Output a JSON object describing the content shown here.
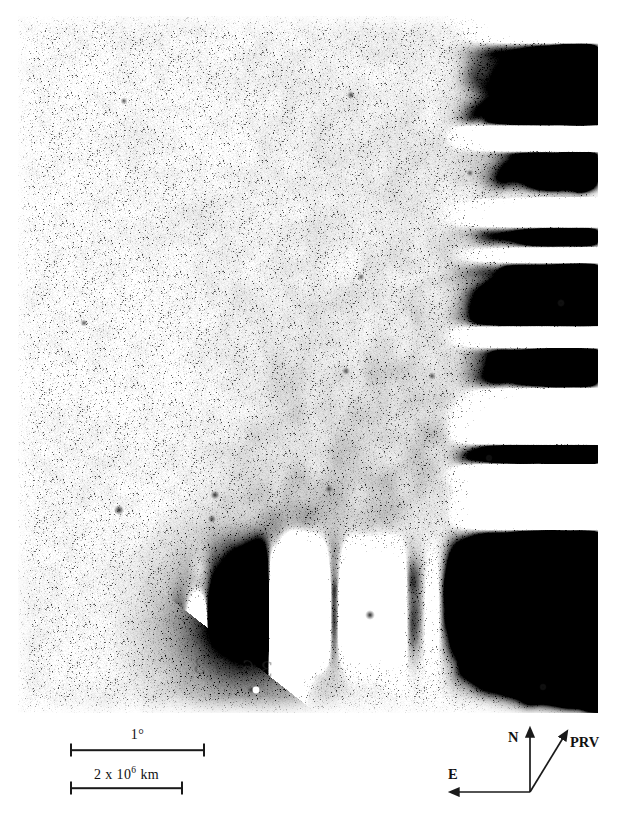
{
  "figure": {
    "kind": "astronomical-plate-photograph",
    "background_color": "#ffffff",
    "plate_tone": "#fbfbfb",
    "ink_color": "#1a1a1a"
  },
  "plate": {
    "annotation_text": "36.73",
    "emulsion": "grainy photographic negative (dark = bright sky objects)"
  },
  "scalebars": [
    {
      "id": "angular-scale",
      "label": "1",
      "label_suffix": "°",
      "label_full": "1°",
      "x": 70,
      "y": 750,
      "width": 135
    },
    {
      "id": "linear-scale",
      "label_prefix": "2 x 10",
      "label_exponent": "6",
      "label_unit": "km",
      "label_full": "2 x 10⁶ km",
      "x": 70,
      "y": 788,
      "width": 113
    }
  ],
  "compass": {
    "origin_label": "direction-key",
    "arrows": [
      {
        "id": "north",
        "label": "N",
        "direction": "up"
      },
      {
        "id": "east",
        "label": "E",
        "direction": "left"
      },
      {
        "id": "prv",
        "label": "PRV",
        "direction": "up-right"
      }
    ]
  },
  "chart_data": {
    "type": "scatter",
    "title": "",
    "xlabel": "",
    "ylabel": "",
    "legend": [],
    "annotations": [
      "1°",
      "2 x 10⁶ km",
      "N",
      "E",
      "PRV"
    ],
    "comet": {
      "nucleus_x": 249,
      "nucleus_y": 622,
      "coma_radius": 46,
      "tail_position_angle_deg": 38,
      "tail_length_px": 660,
      "tail_opening_deg": 30
    },
    "field_stars": [
      {
        "x": 119,
        "y": 510,
        "mag": 3.4
      },
      {
        "x": 215,
        "y": 495,
        "mag": 3.0
      },
      {
        "x": 212,
        "y": 519,
        "mag": 2.6
      },
      {
        "x": 329,
        "y": 489,
        "mag": 2.4
      },
      {
        "x": 370,
        "y": 615,
        "mag": 3.2
      },
      {
        "x": 346,
        "y": 371,
        "mag": 2.2
      },
      {
        "x": 432,
        "y": 376,
        "mag": 2.2
      },
      {
        "x": 489,
        "y": 458,
        "mag": 2.0
      },
      {
        "x": 351,
        "y": 95,
        "mag": 2.4
      },
      {
        "x": 124,
        "y": 101,
        "mag": 2.0
      },
      {
        "x": 361,
        "y": 277,
        "mag": 2.0
      },
      {
        "x": 543,
        "y": 687,
        "mag": 2.0
      },
      {
        "x": 251,
        "y": 690,
        "mag": 2.2
      },
      {
        "x": 84,
        "y": 323,
        "mag": 2.0
      },
      {
        "x": 470,
        "y": 173,
        "mag": 2.0
      },
      {
        "x": 561,
        "y": 303,
        "mag": 2.2
      }
    ]
  }
}
